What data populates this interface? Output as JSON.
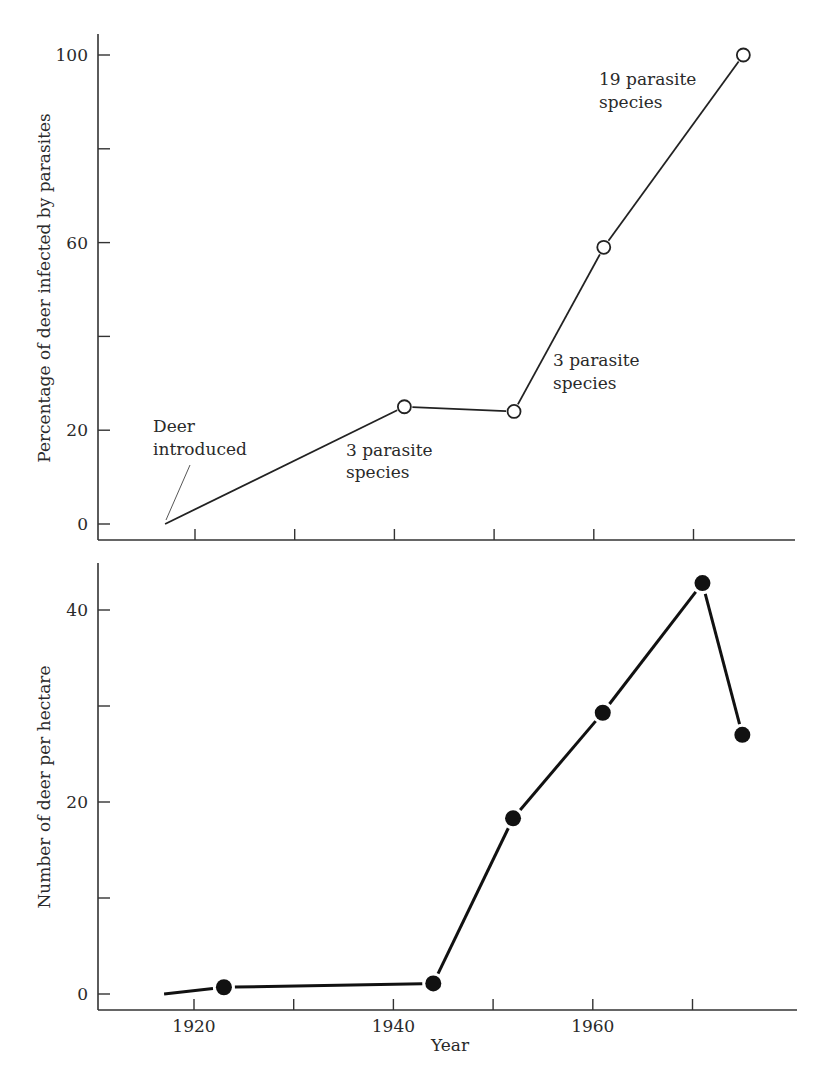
{
  "chart_data": [
    {
      "type": "line",
      "title": "",
      "xlabel": "",
      "ylabel": "Percentage of deer infected by parasites",
      "ylim": [
        0,
        100
      ],
      "yticks": [
        0,
        20,
        40,
        60,
        80,
        100
      ],
      "ytick_labels": [
        "0",
        "20",
        "",
        "60",
        "",
        "100"
      ],
      "xlim": [
        1910,
        1980
      ],
      "xticks": [
        1920,
        1930,
        1940,
        1950,
        1960,
        1970
      ],
      "xtick_labels": [
        "",
        "",
        "",
        "",
        "",
        ""
      ],
      "marker": "open-circle",
      "grid": false,
      "series": [
        {
          "name": "Percentage infected",
          "x": [
            1917,
            1941,
            1952,
            1961,
            1975
          ],
          "y": [
            0,
            25,
            24,
            59,
            100
          ],
          "markers": [
            false,
            true,
            true,
            true,
            true
          ]
        }
      ],
      "annotations": [
        {
          "lines": [
            "Deer",
            "introduced"
          ],
          "x": 1917,
          "y": 0,
          "has_pointer": true
        },
        {
          "lines": [
            "3 parasite",
            "species"
          ],
          "x": 1941,
          "y": 25
        },
        {
          "lines": [
            "3 parasite",
            "species"
          ],
          "x": 1956,
          "y": 38
        },
        {
          "lines": [
            "19 parasite",
            "species"
          ],
          "x": 1970,
          "y": 100
        }
      ]
    },
    {
      "type": "line",
      "title": "",
      "xlabel": "Year",
      "ylabel": "Number of deer per hectare",
      "ylim": [
        0,
        40
      ],
      "yticks": [
        0,
        10,
        20,
        30,
        40
      ],
      "ytick_labels": [
        "0",
        "",
        "20",
        "",
        "40"
      ],
      "xlim": [
        1910,
        1980
      ],
      "xticks": [
        1920,
        1930,
        1940,
        1950,
        1960,
        1970
      ],
      "xtick_labels": [
        "1920",
        "",
        "1940",
        "",
        "1960",
        ""
      ],
      "marker": "filled-circle",
      "grid": false,
      "series": [
        {
          "name": "Deer density",
          "x": [
            1917,
            1923,
            1944,
            1952,
            1961,
            1971,
            1975
          ],
          "y": [
            0,
            0.7,
            1.1,
            18.3,
            29.3,
            42.8,
            27
          ],
          "markers": [
            false,
            true,
            true,
            true,
            true,
            true,
            true
          ]
        }
      ]
    }
  ],
  "layout": {
    "top": {
      "axis_left": 98,
      "axis_top": 34,
      "axis_bottom": 540,
      "axis_right": 795,
      "y0_px": 524,
      "y_per_unit": 4.69,
      "x_ref_year": 1920,
      "x_ref_px": 195,
      "px_per_year": 9.97,
      "annot_px": [
        {
          "x": 153,
          "y1": 432,
          "y2": 455,
          "pointer": [
            190,
            465,
            166,
            520
          ]
        },
        {
          "x": 346,
          "y1": 456,
          "y2": 478
        },
        {
          "x": 553,
          "y1": 366,
          "y2": 389
        },
        {
          "x": 599,
          "y1": 85,
          "y2": 108
        }
      ]
    },
    "bottom": {
      "axis_left": 98,
      "axis_top": 563,
      "axis_bottom": 1010,
      "axis_right": 797,
      "y0_px": 994,
      "y_per_unit": 9.6,
      "x_ref_year": 1920,
      "x_ref_px": 194,
      "px_per_year": 9.97
    }
  }
}
